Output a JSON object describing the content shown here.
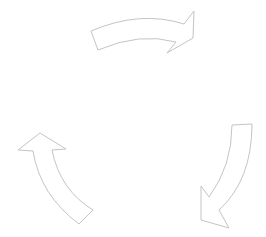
{
  "diagram": {
    "type": "cycle",
    "background": "#ffffff",
    "stroke_color": "#c4c4c4",
    "fill_color": "#ffffff",
    "arrows": [
      {
        "id": "top",
        "direction": "right",
        "position": "top-center",
        "path": "M91,31 Q140,10 184,24 L194,11 L193,38 L167,53 L176,42 Q140,32 98,50 Z"
      },
      {
        "id": "right",
        "direction": "down-left",
        "position": "bottom-right",
        "path": "M232,125 L252,124 Q252,180 219,210 L229,228 L201,220 L201,186 L209,197 Q232,166 232,125 Z"
      },
      {
        "id": "left",
        "direction": "up",
        "position": "bottom-left",
        "path": "M93,210 L79,224 Q40,195 33,151 L18,150 L40,133 L66,149 L52,150 Q60,190 93,210 Z"
      }
    ],
    "labels": []
  }
}
